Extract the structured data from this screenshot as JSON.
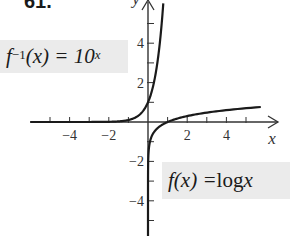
{
  "problem_number": "61.",
  "labels": {
    "inverse": {
      "f": "f",
      "sup1": "−1",
      "arg": "(x) = 10",
      "sup2": "x"
    },
    "log": {
      "text_f": "f",
      "text_rest": "(x) = ",
      "log": "log",
      "var": " x"
    }
  },
  "axes": {
    "x_name": "x",
    "y_name": "y"
  },
  "colors": {
    "curve": "#1a1a1a",
    "axis": "#333333",
    "label_bg": "#ebebeb"
  },
  "chart_data": {
    "type": "line",
    "title": "",
    "xlabel": "x",
    "ylabel": "y",
    "xlim": [
      -5.9,
      6.6
    ],
    "ylim": [
      -5.9,
      6.2
    ],
    "grid": false,
    "x_ticks": [
      -5,
      -4,
      -3,
      -2,
      -1,
      1,
      2,
      3,
      4,
      5
    ],
    "x_tick_labels": {
      "-4": "−4",
      "-2": "−2",
      "2": "2",
      "4": "4"
    },
    "y_ticks": [
      -5,
      -4,
      -3,
      -2,
      -1,
      1,
      2,
      3,
      4,
      5
    ],
    "y_tick_labels": {
      "4": "4",
      "2": "2",
      "-2": "−2",
      "-4": "−4"
    },
    "series": [
      {
        "name": "f^{-1}(x) = 10^x",
        "function": "10^x",
        "x": [
          -6,
          -4,
          -2,
          -1,
          -0.5,
          0,
          0.3,
          0.5,
          0.7,
          0.78
        ],
        "y": [
          1e-06,
          0.0001,
          0.01,
          0.1,
          0.316,
          1,
          1.995,
          3.162,
          5.012,
          6.0
        ]
      },
      {
        "name": "f(x) = log x",
        "function": "log10(x)",
        "x": [
          1e-06,
          0.01,
          0.1,
          0.5,
          1,
          2,
          4,
          6
        ],
        "y": [
          -6,
          -2,
          -1,
          -0.301,
          0,
          0.301,
          0.602,
          0.778
        ]
      }
    ],
    "annotations": [
      {
        "text": "f^{-1}(x) = 10^x",
        "position": "upper-left"
      },
      {
        "text": "f(x) = log x",
        "position": "lower-right"
      }
    ]
  }
}
